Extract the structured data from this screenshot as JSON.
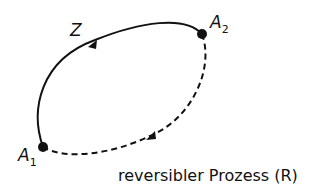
{
  "diagram": {
    "labels": {
      "z": "Z",
      "a1_main": "A",
      "a1_sub": "1",
      "a2_main": "A",
      "a2_sub": "2"
    },
    "caption": "reversibler Prozess (R)",
    "colors": {
      "stroke": "#111111",
      "background": "#ffffff"
    }
  }
}
